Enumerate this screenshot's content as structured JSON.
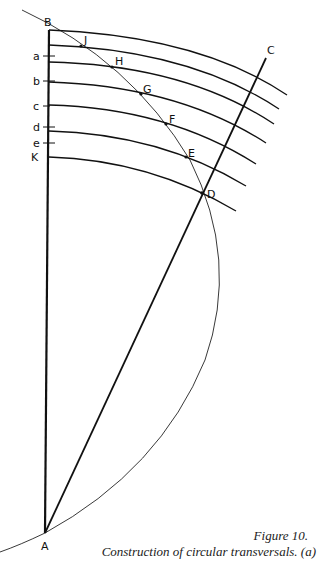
{
  "figure": {
    "caption_title": "Figure 10.",
    "caption_text": "Construction of circular transversals. (a)"
  },
  "points": {
    "A": "A",
    "B": "B",
    "C": "C",
    "D": "D",
    "E": "E",
    "F": "F",
    "G": "G",
    "H": "H",
    "J": "J",
    "K": "K"
  },
  "ticks": {
    "a": "a",
    "b": "b",
    "c": "c",
    "d": "d",
    "e": "e"
  },
  "colors": {
    "ink": "#111111",
    "background": "#ffffff"
  }
}
